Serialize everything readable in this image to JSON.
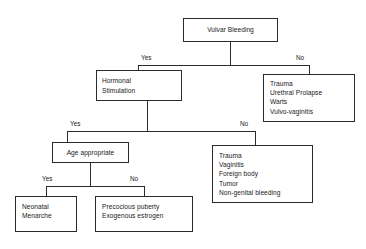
{
  "diagram": {
    "line_color": "#2b2b2b",
    "background": "#ffffff",
    "nodes": {
      "root": "Vulvar Bleeding",
      "hormonal": "Hormonal\nStimulation",
      "nonhormonal": "Trauma\nUrethral  Prolapse\nWarts\nVulvo-vaginitis",
      "age_appropriate": "Age appropriate",
      "non_hormonal_causes": "Trauma\nVaginitis\nForeign body\nTumor\nNon-genital bleeding",
      "neonatal": "Neonatal\nMenarche",
      "precocious": "Precocious puberty\nExogenous estrogen"
    },
    "labels": {
      "l1_yes": "Yes",
      "l1_no": "No",
      "l2_yes": "Yes",
      "l2_no": "No",
      "l3_yes": "Yes",
      "l3_no": "No"
    }
  }
}
